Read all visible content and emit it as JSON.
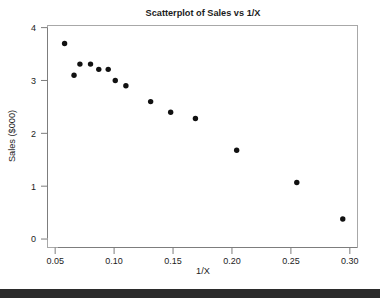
{
  "chart_data": {
    "type": "scatter",
    "title": "Scatterplot of Sales vs 1/X",
    "xlabel": "1/X",
    "ylabel": "Sales ($000)",
    "xlim": [
      0.0435,
      0.3065
    ],
    "ylim": [
      -0.16,
      4.04
    ],
    "grid": false,
    "legend": null,
    "xticks": [
      0.05,
      0.1,
      0.15,
      0.2,
      0.25,
      0.3
    ],
    "xtick_labels": [
      "0.05",
      "0.10",
      "0.15",
      "0.20",
      "0.25",
      "0.30"
    ],
    "yticks": [
      0,
      1,
      2,
      3,
      4
    ],
    "ytick_labels": [
      "0",
      "1",
      "2",
      "3",
      "4"
    ],
    "marker": "filled-circle",
    "marker_color": "#111111",
    "points": [
      {
        "x": 0.058,
        "y": 3.7
      },
      {
        "x": 0.066,
        "y": 3.1
      },
      {
        "x": 0.071,
        "y": 3.31
      },
      {
        "x": 0.08,
        "y": 3.31
      },
      {
        "x": 0.087,
        "y": 3.21
      },
      {
        "x": 0.095,
        "y": 3.21
      },
      {
        "x": 0.101,
        "y": 3.0
      },
      {
        "x": 0.11,
        "y": 2.9
      },
      {
        "x": 0.131,
        "y": 2.6
      },
      {
        "x": 0.148,
        "y": 2.4
      },
      {
        "x": 0.169,
        "y": 2.28
      },
      {
        "x": 0.204,
        "y": 1.68
      },
      {
        "x": 0.255,
        "y": 1.07
      },
      {
        "x": 0.294,
        "y": 0.38
      }
    ]
  },
  "figure": {
    "background_color": "#ffffff",
    "frame_color": "#a8a8a8",
    "axis_color": "#7d7d7d",
    "text_color": "#1c1c1c"
  },
  "bottom_bar": {
    "color": "#2b2b2b"
  }
}
